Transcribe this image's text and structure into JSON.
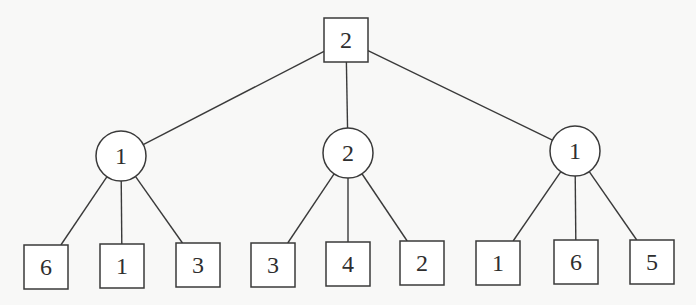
{
  "diagram": {
    "type": "game-tree",
    "colors": {
      "background": "#f8f8f7",
      "stroke": "#3a3a3a",
      "text": "#2e2e2e",
      "fill": "#ffffff"
    },
    "root": {
      "id": "root",
      "shape": "square",
      "label": "2",
      "x": 346,
      "y": 40,
      "size": 44
    },
    "level1": [
      {
        "id": "c1",
        "shape": "circle",
        "label": "1",
        "x": 121,
        "y": 156,
        "r": 25
      },
      {
        "id": "c2",
        "shape": "circle",
        "label": "2",
        "x": 348,
        "y": 153,
        "r": 25
      },
      {
        "id": "c3",
        "shape": "circle",
        "label": "1",
        "x": 575,
        "y": 151,
        "r": 25
      }
    ],
    "leaves": [
      {
        "id": "l1",
        "parent": "c1",
        "shape": "square",
        "label": "6",
        "x": 46,
        "y": 267,
        "size": 44
      },
      {
        "id": "l2",
        "parent": "c1",
        "shape": "square",
        "label": "1",
        "x": 122,
        "y": 266,
        "size": 44
      },
      {
        "id": "l3",
        "parent": "c1",
        "shape": "square",
        "label": "3",
        "x": 198,
        "y": 265,
        "size": 44
      },
      {
        "id": "l4",
        "parent": "c2",
        "shape": "square",
        "label": "3",
        "x": 273,
        "y": 265,
        "size": 44
      },
      {
        "id": "l5",
        "parent": "c2",
        "shape": "square",
        "label": "4",
        "x": 348,
        "y": 264,
        "size": 44
      },
      {
        "id": "l6",
        "parent": "c2",
        "shape": "square",
        "label": "2",
        "x": 422,
        "y": 263,
        "size": 44
      },
      {
        "id": "l7",
        "parent": "c3",
        "shape": "square",
        "label": "1",
        "x": 498,
        "y": 263,
        "size": 44
      },
      {
        "id": "l8",
        "parent": "c3",
        "shape": "square",
        "label": "6",
        "x": 576,
        "y": 262,
        "size": 44
      },
      {
        "id": "l9",
        "parent": "c3",
        "shape": "square",
        "label": "5",
        "x": 652,
        "y": 262,
        "size": 44
      }
    ]
  }
}
